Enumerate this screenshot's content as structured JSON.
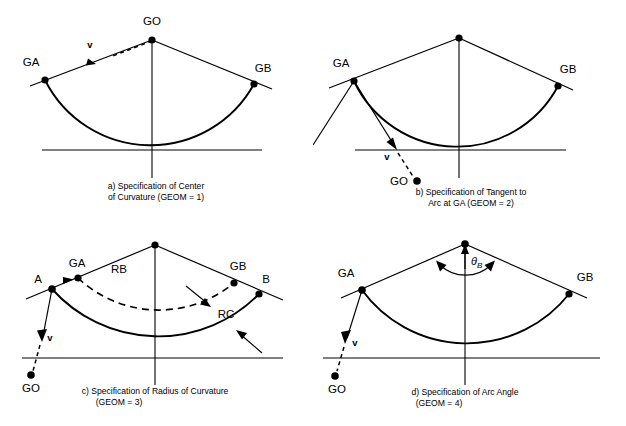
{
  "figure": {
    "background": "#ffffff",
    "ink": "#000000"
  },
  "panels": [
    {
      "id": "a",
      "caption_line1": "a) Specification of Center",
      "caption_line2": "of Curvature (GEOM  =  1)",
      "geom_value": "1",
      "labels": {
        "apex": "GO",
        "left_point": "GA",
        "right_point": "GB",
        "vector": "v"
      }
    },
    {
      "id": "b",
      "caption_line1": "b) Specification of Tangent to",
      "caption_line2": "Arc at GA (GEOM  =  2)",
      "geom_value": "2",
      "labels": {
        "left_point": "GA",
        "right_point": "GB",
        "center": "GO",
        "vector": "v"
      }
    },
    {
      "id": "c",
      "caption_line1": "c) Specification of Radius of Curvature",
      "caption_line2": "(GEOM  =  3)",
      "geom_value": "3",
      "labels": {
        "point_a": "A",
        "left_point": "GA",
        "right_point": "GB",
        "point_b": "B",
        "radius_begin": "RB",
        "radius_curvature": "RC",
        "center": "GO",
        "vector": "v"
      }
    },
    {
      "id": "d",
      "caption_line1": "d) Specification of Arc Angle",
      "caption_line2": "(GEOM  =  4)",
      "geom_value": "4",
      "labels": {
        "left_point": "GA",
        "right_point": "GB",
        "angle": "θ",
        "angle_subscript": "B",
        "center": "GO",
        "vector": "v"
      }
    }
  ]
}
